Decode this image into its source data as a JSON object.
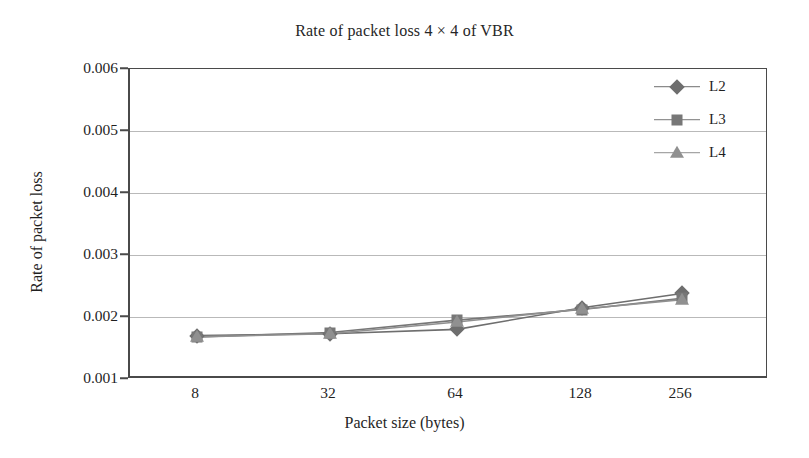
{
  "chart_data": {
    "type": "line",
    "title": "Rate of packet loss 4 × 4 of VBR",
    "xlabel": "Packet size (bytes)",
    "ylabel": "Rate of packet loss",
    "categories": [
      "8",
      "32",
      "64",
      "128",
      "256"
    ],
    "ylim": [
      0.001,
      0.006
    ],
    "yticks": [
      "0.001",
      "0.002",
      "0.003",
      "0.004",
      "0.005",
      "0.006"
    ],
    "ytick_values": [
      0.001,
      0.002,
      0.003,
      0.004,
      0.005,
      0.006
    ],
    "grid": true,
    "legend_position": "top-right",
    "series": [
      {
        "name": "L2",
        "marker": "diamond",
        "color": "#6e6e6e",
        "values": [
          0.0017,
          0.00173,
          0.0018,
          0.00215,
          0.00238
        ]
      },
      {
        "name": "L3",
        "marker": "square",
        "color": "#777777",
        "values": [
          0.00168,
          0.00175,
          0.00195,
          0.00212,
          0.0023
        ]
      },
      {
        "name": "L4",
        "marker": "triangle",
        "color": "#909090",
        "values": [
          0.00168,
          0.00173,
          0.00192,
          0.00213,
          0.00228
        ]
      }
    ]
  },
  "colors": {
    "axis": "#4a4a4a",
    "grid": "#b9b9b9",
    "text": "#1f1f1f",
    "background": "#ffffff"
  }
}
